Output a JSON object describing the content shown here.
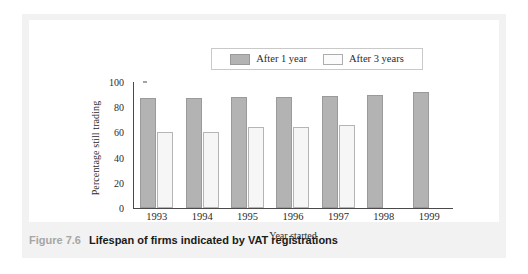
{
  "caption": {
    "number": "Figure 7.6",
    "title": "Lifespan of firms indicated by VAT registrations"
  },
  "colors": {
    "one_year_fill": "#b3b3b3",
    "one_year_stroke": "#9a9a9a",
    "three_year_fill": "#f6f6f6",
    "three_year_stroke": "#b5b5b5",
    "axis": "#4a4a4a",
    "band": "#f2f2f2",
    "panel": "#ffffff",
    "caption_number": "#a6a6a6",
    "caption_title": "#1a1a1a"
  },
  "chart_data": {
    "type": "bar",
    "title": "",
    "xlabel": "Year started",
    "ylabel": "Percentage still trading",
    "categories": [
      "1993",
      "1994",
      "1995",
      "1996",
      "1997",
      "1998",
      "1999"
    ],
    "series": [
      {
        "name": "After 1 year",
        "values": [
          87,
          87,
          88,
          88,
          89,
          90,
          92
        ]
      },
      {
        "name": "After 3 years",
        "values": [
          60,
          60,
          64,
          64,
          66,
          null,
          null
        ]
      }
    ],
    "ylim": [
      0,
      100
    ],
    "yticks": [
      0,
      20,
      40,
      60,
      80,
      100
    ],
    "ytick_labels": [
      "0",
      "20",
      "40",
      "60",
      "80",
      "100"
    ],
    "grid": false,
    "legend_position": "top-center"
  }
}
